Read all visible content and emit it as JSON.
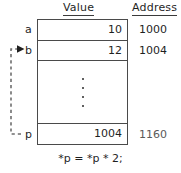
{
  "headers": {
    "value": "Value",
    "address": "Address"
  },
  "rows": [
    {
      "label": "a",
      "value": "10",
      "address": "1000"
    },
    {
      "label": "b",
      "value": "12",
      "address": "1004"
    },
    {
      "label": "",
      "value": "",
      "address": ""
    },
    {
      "label": "p",
      "value": "1004",
      "address": "1160"
    }
  ],
  "ellipsis": {
    "dot_count": 4,
    "meaning": "vertical-ellipsis"
  },
  "pointer": {
    "from_label": "p",
    "to_label": "b",
    "style": "dashed",
    "arrowhead": "solid-triangle"
  },
  "caption": "*p = *p * 2;",
  "colors": {
    "stroke": "#4a4a4a",
    "text": "#1f1f1f",
    "faded_text": "#5a5a5a",
    "background": "#ffffff"
  }
}
